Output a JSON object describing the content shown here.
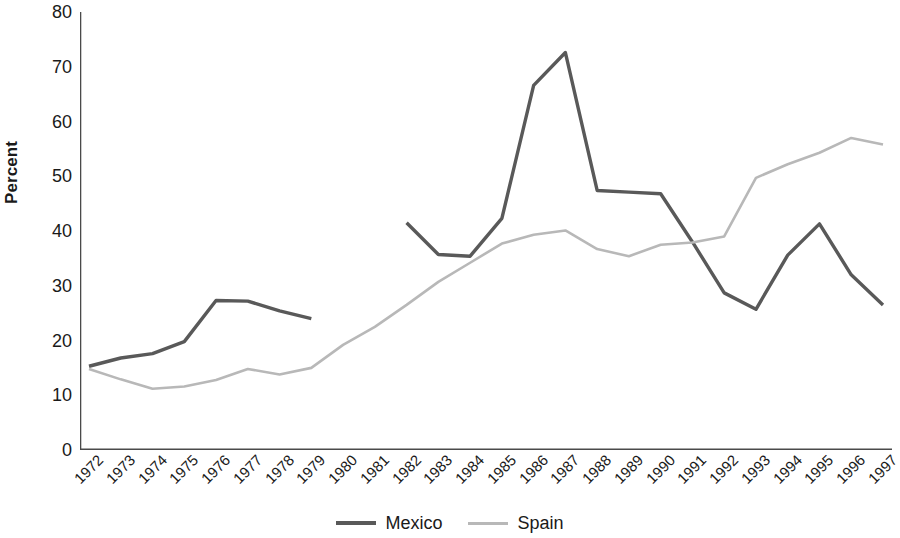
{
  "chart_data": {
    "type": "line",
    "title": "",
    "xlabel": "",
    "ylabel": "Percent",
    "ylim": [
      0,
      80
    ],
    "yticks": [
      0,
      10,
      20,
      30,
      40,
      50,
      60,
      70,
      80
    ],
    "grid": false,
    "legend_position": "bottom-center",
    "x": [
      1972,
      1973,
      1974,
      1975,
      1976,
      1977,
      1978,
      1979,
      1980,
      1981,
      1982,
      1983,
      1984,
      1985,
      1986,
      1987,
      1988,
      1989,
      1990,
      1991,
      1992,
      1993,
      1994,
      1995,
      1996,
      1997
    ],
    "categories": [
      "1972",
      "1973",
      "1974",
      "1975",
      "1976",
      "1977",
      "1978",
      "1979",
      "1980",
      "1981",
      "1982",
      "1983",
      "1984",
      "1985",
      "1986",
      "1987",
      "1988",
      "1989",
      "1990",
      "1991",
      "1992",
      "1993",
      "1994",
      "1995",
      "1996",
      "1997"
    ],
    "series": [
      {
        "name": "Mexico",
        "color": "#595959",
        "values": [
          15.3,
          16.8,
          17.6,
          19.8,
          27.3,
          27.2,
          25.4,
          24.0,
          null,
          null,
          41.5,
          35.7,
          35.4,
          42.3,
          66.6,
          72.6,
          47.4,
          47.1,
          46.8,
          38.0,
          28.7,
          25.7,
          35.6,
          41.3,
          32.0,
          26.5
        ]
      },
      {
        "name": "Spain",
        "color": "#b8b8b8",
        "values": [
          14.8,
          12.9,
          11.2,
          11.6,
          12.8,
          14.8,
          13.8,
          15.0,
          19.2,
          22.5,
          26.5,
          30.7,
          34.2,
          37.7,
          39.3,
          40.1,
          36.7,
          35.4,
          37.5,
          37.9,
          39.0,
          49.7,
          52.2,
          54.3,
          57.0,
          55.8
        ]
      }
    ]
  },
  "legend": {
    "entries": [
      {
        "label": "Mexico",
        "color": "#595959"
      },
      {
        "label": "Spain",
        "color": "#b8b8b8"
      }
    ]
  },
  "axis": {
    "y_title": "Percent"
  }
}
